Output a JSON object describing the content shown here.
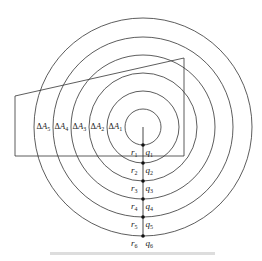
{
  "diagram": {
    "type": "concentric-circles-with-field-polygon",
    "center": {
      "x": 143,
      "y": 127
    },
    "stroke_color": "#333333",
    "circle_radii": [
      18,
      36,
      54,
      72,
      90,
      109
    ],
    "polygon_points": [
      [
        15,
        96
      ],
      [
        184,
        58
      ],
      [
        184,
        156
      ],
      [
        15,
        156
      ]
    ],
    "radial_line": {
      "x": 143,
      "y1": 127,
      "y2": 236
    },
    "area_labels": [
      {
        "delta": "ΔA",
        "sub": "5",
        "x": 36
      },
      {
        "delta": "ΔA",
        "sub": "4",
        "x": 54
      },
      {
        "delta": "ΔA",
        "sub": "3",
        "x": 72
      },
      {
        "delta": "ΔA",
        "sub": "2",
        "x": 90
      },
      {
        "delta": "ΔA",
        "sub": "1",
        "x": 108
      }
    ],
    "area_labels_y": 129,
    "radius_labels": [
      {
        "r": "r",
        "r_sub": "1",
        "q": "q",
        "q_sub": "1",
        "dot_y": 145
      },
      {
        "r": "r",
        "r_sub": "2",
        "q": "q",
        "q_sub": "2",
        "dot_y": 163
      },
      {
        "r": "r",
        "r_sub": "3",
        "q": "q",
        "q_sub": "3",
        "dot_y": 181
      },
      {
        "r": "r",
        "r_sub": "4",
        "q": "q",
        "q_sub": "4",
        "dot_y": 199
      },
      {
        "r": "r",
        "r_sub": "5",
        "q": "q",
        "q_sub": "5",
        "dot_y": 217
      },
      {
        "r": "r",
        "r_sub": "6",
        "q": "q",
        "q_sub": "6",
        "dot_y": 236
      }
    ]
  }
}
